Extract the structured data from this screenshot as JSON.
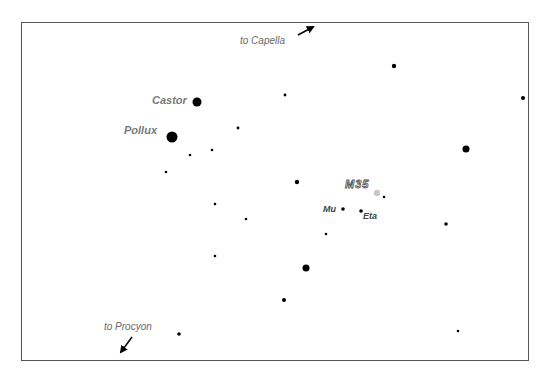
{
  "chart": {
    "type": "star-finder-chart",
    "frame": {
      "x": 21,
      "y": 22,
      "width": 507,
      "height": 338,
      "border_color": "#555555"
    },
    "star_color": "#000000",
    "cluster_color": "#c8c8c8",
    "pointers": [
      {
        "label": "to  Capella",
        "label_x": 240,
        "label_y": 31,
        "arrow": {
          "x1": 298,
          "y1": 35,
          "x2": 313,
          "y2": 27
        }
      },
      {
        "label": "to  Procyon",
        "label_x": 104,
        "label_y": 323,
        "arrow": {
          "x1": 132,
          "y1": 337,
          "x2": 121,
          "y2": 352
        }
      }
    ],
    "named_stars": [
      {
        "name": "Castor",
        "x": 197,
        "y": 102,
        "r": 4.5,
        "label_x": 152,
        "label_y": 95
      },
      {
        "name": "Pollux",
        "x": 172,
        "y": 137,
        "r": 5.5,
        "label_x": 124,
        "label_y": 125
      },
      {
        "name": "Mu",
        "x": 343,
        "y": 209,
        "r": 1.8,
        "label_x": 323,
        "label_y": 205
      },
      {
        "name": "Eta",
        "x": 361,
        "y": 211,
        "r": 1.8,
        "label_x": 363,
        "label_y": 212
      }
    ],
    "cluster": {
      "name": "M35",
      "x": 377,
      "y": 193,
      "r": 3.2,
      "label_x": 345,
      "label_y": 179
    },
    "stars": [
      {
        "x": 394,
        "y": 66,
        "r": 2.2
      },
      {
        "x": 523,
        "y": 98,
        "r": 2.0
      },
      {
        "x": 285,
        "y": 95,
        "r": 1.4
      },
      {
        "x": 238,
        "y": 128,
        "r": 1.4
      },
      {
        "x": 466,
        "y": 149,
        "r": 3.5
      },
      {
        "x": 190,
        "y": 155,
        "r": 1.3
      },
      {
        "x": 212,
        "y": 150,
        "r": 1.3
      },
      {
        "x": 166,
        "y": 172,
        "r": 1.3
      },
      {
        "x": 297,
        "y": 182,
        "r": 2.2
      },
      {
        "x": 384,
        "y": 197,
        "r": 1.3
      },
      {
        "x": 215,
        "y": 204,
        "r": 1.3
      },
      {
        "x": 246,
        "y": 219,
        "r": 1.3
      },
      {
        "x": 446,
        "y": 224,
        "r": 1.8
      },
      {
        "x": 326,
        "y": 234,
        "r": 1.3
      },
      {
        "x": 215,
        "y": 256,
        "r": 1.3
      },
      {
        "x": 306,
        "y": 268,
        "r": 3.5
      },
      {
        "x": 284,
        "y": 300,
        "r": 2.0
      },
      {
        "x": 179,
        "y": 334,
        "r": 1.8
      },
      {
        "x": 458,
        "y": 331,
        "r": 1.3
      }
    ]
  }
}
